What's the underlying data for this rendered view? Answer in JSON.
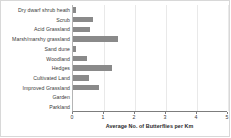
{
  "chart_data": {
    "type": "bar",
    "orientation": "horizontal",
    "title": "",
    "xlabel": "Average No. of Butterflies per Km",
    "ylabel": "",
    "categories": [
      "Dry dwarf shrub heath",
      "Scrub",
      "Acid Grassland",
      "Marsh/marshy grassland",
      "Sand dune",
      "Woodland",
      "Hedges",
      "Cultivated Land",
      "Improved Grassland",
      "Garden",
      "Parkland"
    ],
    "values": [
      0.1,
      0.65,
      0.55,
      1.45,
      0.1,
      0.45,
      1.25,
      0.5,
      0.85,
      0,
      0
    ],
    "xlim": [
      0,
      5
    ],
    "xticks": [
      0,
      1,
      2,
      3,
      4,
      5
    ],
    "xtick_labels": [
      "0",
      "1",
      "2",
      "3",
      "4",
      "5"
    ],
    "grid": true,
    "legend": false,
    "bar_color": "#8a8a8a"
  }
}
